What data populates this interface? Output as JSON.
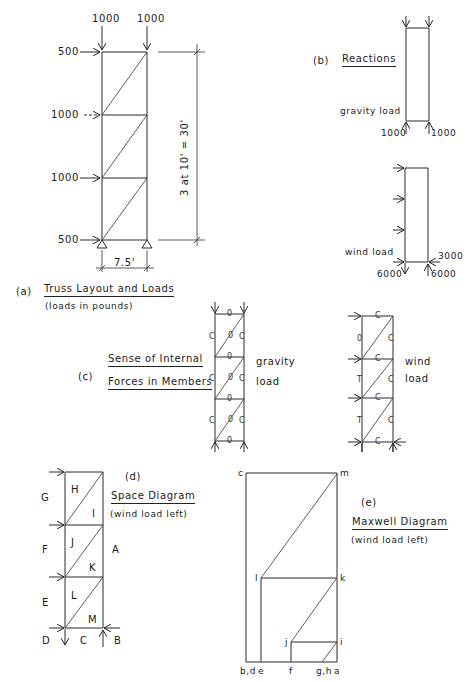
{
  "figure": {
    "panel_a": {
      "tag": "(a)",
      "title": "Truss Layout and Loads",
      "subtitle": "(loads in pounds)",
      "top_loads": [
        "1000",
        "1000"
      ],
      "side_loads": [
        "500",
        "1000",
        "1000",
        "500"
      ],
      "width_dim": "7.5'",
      "height_dim": "3 at 10' = 30'"
    },
    "panel_b": {
      "tag": "(b)",
      "title": "Reactions",
      "gravity": {
        "label": "gravity load",
        "left_reaction": "1000",
        "right_reaction": "1000"
      },
      "wind": {
        "label": "wind load",
        "left_reaction": "6000",
        "right_reaction": "6000",
        "horizontal_reaction": "3000"
      }
    },
    "panel_c": {
      "tag": "(c)",
      "title_line1": "Sense of Internal",
      "title_line2": "Forces in Members",
      "gravity_label_1": "gravity",
      "gravity_label_2": "load",
      "wind_label_1": "wind",
      "wind_label_2": "load",
      "symbols": {
        "zero": "0",
        "compression": "C",
        "tension": "T"
      }
    },
    "panel_d": {
      "tag": "(d)",
      "title": "Space Diagram",
      "subtitle": "(wind load left)",
      "outer_labels": [
        "G",
        "F",
        "E",
        "D",
        "C",
        "B",
        "A"
      ],
      "inner_labels": [
        "H",
        "I",
        "J",
        "K",
        "L",
        "M"
      ]
    },
    "panel_e": {
      "tag": "(e)",
      "title": "Maxwell Diagram",
      "subtitle": "(wind load left)",
      "points": [
        "c",
        "m",
        "l",
        "k",
        "j",
        "i",
        "b,d",
        "e",
        "f",
        "g,h",
        "a"
      ]
    }
  }
}
